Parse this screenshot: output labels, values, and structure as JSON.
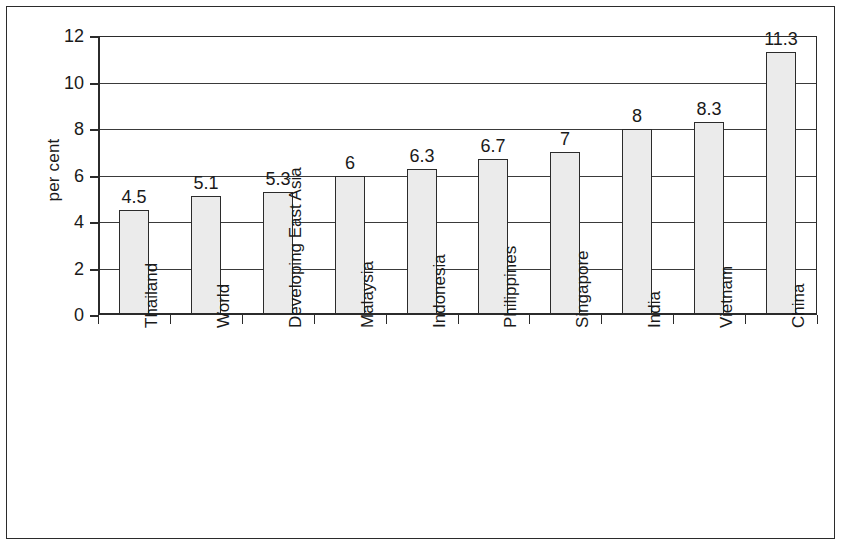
{
  "chart_data": {
    "type": "bar",
    "title": "",
    "subtitle": "",
    "xlabel": "",
    "ylabel": "per cent",
    "categories": [
      "Thailand",
      "World",
      "Developing East Asia",
      "Malaysia",
      "Indonesia",
      "Philippines",
      "Singapore",
      "India",
      "Vietnam",
      "China"
    ],
    "values": [
      4.5,
      5.1,
      5.3,
      6,
      6.3,
      6.7,
      7,
      8,
      8.3,
      11.3
    ],
    "value_labels": [
      "4.5",
      "5.1",
      "5.3",
      "6",
      "6.3",
      "6.7",
      "7",
      "8",
      "8.3",
      "11.3"
    ],
    "ylim": [
      0,
      12
    ],
    "ytick_values": [
      0,
      2,
      4,
      6,
      8,
      10,
      12
    ],
    "ytick_labels": [
      "0",
      "2",
      "4",
      "6",
      "8",
      "10",
      "12"
    ],
    "grid": true,
    "legend": false,
    "legend_position": "none",
    "bar_fill_color": "#ebebeb",
    "bar_border_color": "#2b2b2b",
    "axis_color": "#2b2b2b",
    "background_color": "#ffffff"
  }
}
